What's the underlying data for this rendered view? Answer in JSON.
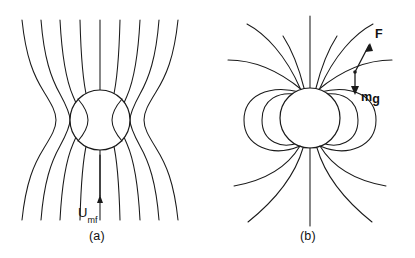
{
  "figure": {
    "type": "diagram",
    "background_color": "#ffffff",
    "line_color": "#1a1a1a",
    "panels": [
      {
        "id": "a",
        "caption": "(a)",
        "particle": {
          "shape": "circle",
          "cx": 100,
          "cy": 120,
          "r": 30
        },
        "streamline_count": 9,
        "flow_direction": "upward",
        "velocity_label": {
          "base": "U",
          "subscript": "mf",
          "full": "Umf"
        },
        "arrow": {
          "name": "flow-arrow",
          "direction": "up"
        }
      },
      {
        "id": "b",
        "caption": "(b)",
        "particle": {
          "shape": "circle",
          "cx": 310,
          "cy": 118,
          "r": 30
        },
        "recirculation_loops": 4,
        "flow_direction": "upward",
        "vectors": [
          {
            "name": "F",
            "label": "F",
            "direction": "up-right"
          },
          {
            "name": "mg",
            "label_m": "m",
            "label_g": "g",
            "label": "mg",
            "direction": "down"
          }
        ]
      }
    ]
  },
  "bottom_caption": {
    "text": ""
  }
}
